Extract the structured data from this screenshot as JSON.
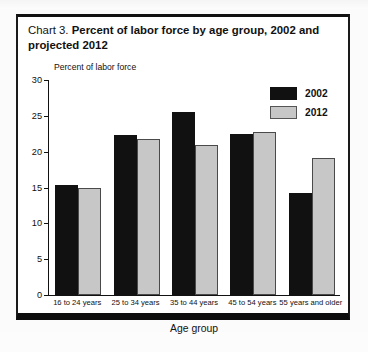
{
  "title": {
    "lead": "Chart 3.",
    "bold": "Percent of labor force by age group, 2002 and projected 2012"
  },
  "axis_caption": "Percent of labor force",
  "legend": [
    {
      "label": "2002",
      "color": "#111111"
    },
    {
      "label": "2012",
      "color": "#c7c7c7"
    }
  ],
  "yticks": [
    "30",
    "25",
    "20",
    "15",
    "10",
    "5",
    "0"
  ],
  "chart_data": {
    "type": "bar",
    "title": "Chart 3. Percent of labor force by age group, 2002 and projected 2012",
    "xlabel": "Age group",
    "ylabel": "Percent of labor force",
    "ylim": [
      0,
      30
    ],
    "ytick_step": 5,
    "grid": false,
    "legend_position": "top-right",
    "categories": [
      "16 to 24 years",
      "25 to 34 years",
      "35 to 44 years",
      "45 to 54 years",
      "55 years and older"
    ],
    "series": [
      {
        "name": "2002",
        "color": "#111111",
        "values": [
          15.4,
          22.3,
          25.6,
          22.4,
          14.2
        ]
      },
      {
        "name": "2012",
        "color": "#c7c7c7",
        "values": [
          15.0,
          21.7,
          21.0,
          22.8,
          19.1
        ]
      }
    ]
  }
}
